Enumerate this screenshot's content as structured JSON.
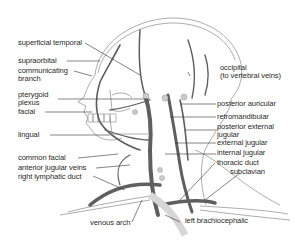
{
  "figure": {
    "colors": {
      "vein": "#5f5f5f",
      "outline": "#8a8a8a",
      "leader": "#333333",
      "lymph": "#d6d6d6",
      "text": "#2a2a2a"
    }
  },
  "labels_left": [
    {
      "id": "superficial-temporal",
      "text": "superficial temporal"
    },
    {
      "id": "supraorbital",
      "text": "supraorbital"
    },
    {
      "id": "communicating-branch",
      "line1": "communicating",
      "line2": "branch"
    },
    {
      "id": "pterygoid-plexus",
      "line1": "pterygoid",
      "line2": "plexus"
    },
    {
      "id": "facial",
      "text": "facial"
    },
    {
      "id": "lingual",
      "text": "lingual"
    },
    {
      "id": "common-facial",
      "text": "common facial"
    },
    {
      "id": "anterior-jugular-veins",
      "text": "anterior jugular veins"
    },
    {
      "id": "right-lymphatic-duct",
      "text": "right lymphatic duct"
    },
    {
      "id": "venous-arch",
      "text": "venous arch"
    }
  ],
  "labels_right": [
    {
      "id": "occipital",
      "line1": "occipital",
      "line2": "(to vertebral veins)"
    },
    {
      "id": "posterior-auricular",
      "text": "posterior auricular"
    },
    {
      "id": "retromandibular",
      "text": "retromandibular"
    },
    {
      "id": "posterior-external-jugular",
      "line1": "posterior external",
      "line2": "jugular"
    },
    {
      "id": "external-jugular",
      "text": "external jugular"
    },
    {
      "id": "internal-jugular",
      "text": "internal jugular"
    },
    {
      "id": "thoracic-duct",
      "text": "thoracic duct"
    },
    {
      "id": "subclavian",
      "text": "subclavian"
    },
    {
      "id": "left-brachiocephalic",
      "text": "left brachiocephalic"
    }
  ]
}
